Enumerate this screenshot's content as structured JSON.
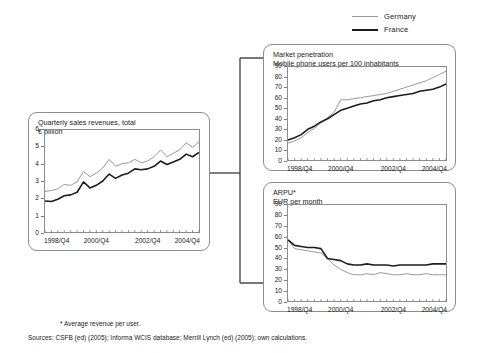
{
  "legend": {
    "items": [
      {
        "label": "Germany",
        "color": "#9a9a9a",
        "style": "thin"
      },
      {
        "label": "France",
        "color": "#1c1c1c",
        "style": "thick"
      }
    ]
  },
  "footnotes": {
    "star": "* Average revenue per user.",
    "sources": "Sources: CSFB (ed) (2005); Informa WCIS database; Merrill Lynch (ed) (2005); own calculations."
  },
  "panels": {
    "left": {
      "title_line1": "Quarterly sales revenues, total",
      "title_line2": "€ billion"
    },
    "penetration": {
      "title_line1": "Market penetration",
      "title_line2": "Mobile phone users per 100 inhabitants"
    },
    "arpu": {
      "title_line1": "ARPU*",
      "title_line2": "EUR per month"
    }
  },
  "chart_data": [
    {
      "id": "left",
      "type": "line",
      "title": "Quarterly sales revenues, total",
      "ylabel": "€ billion",
      "xlabel": "",
      "ylim": [
        0,
        6
      ],
      "yticks": [
        0,
        1,
        2,
        3,
        4,
        5,
        6
      ],
      "ytick_labels": [
        "0",
        "1",
        "2",
        "3",
        "4",
        "5",
        "6"
      ],
      "xtick_labels": [
        "1998/Q4",
        "2000/Q4",
        "2002/Q4",
        "2004/Q4"
      ],
      "xtick_positions": [
        0,
        8,
        16,
        24
      ],
      "x_count": 25,
      "grid": false,
      "legend_position": "top-right-external",
      "series": [
        {
          "name": "Germany",
          "color": "#9a9a9a",
          "values": [
            2.4,
            2.45,
            2.55,
            2.8,
            2.75,
            2.95,
            3.55,
            3.25,
            3.45,
            3.75,
            4.25,
            3.85,
            4.0,
            4.05,
            4.25,
            4.05,
            4.15,
            4.4,
            4.8,
            4.4,
            4.6,
            4.8,
            5.2,
            4.95,
            5.25
          ]
        },
        {
          "name": "France",
          "color": "#1c1c1c",
          "values": [
            1.85,
            1.82,
            1.95,
            2.15,
            2.2,
            2.35,
            2.95,
            2.6,
            2.75,
            3.0,
            3.4,
            3.15,
            3.35,
            3.45,
            3.7,
            3.65,
            3.7,
            3.85,
            4.15,
            3.95,
            4.1,
            4.25,
            4.55,
            4.4,
            4.65
          ]
        }
      ]
    },
    {
      "id": "penetration",
      "type": "line",
      "title": "Market penetration",
      "ylabel": "Mobile phone users per 100 inhabitants",
      "xlabel": "",
      "ylim": [
        0,
        90
      ],
      "yticks": [
        0,
        10,
        20,
        30,
        40,
        50,
        60,
        70,
        80,
        90
      ],
      "ytick_labels": [
        "0",
        "10",
        "20",
        "30",
        "40",
        "50",
        "60",
        "70",
        "80",
        "90"
      ],
      "xtick_labels": [
        "1998/Q4",
        "2000/Q4",
        "2002/Q4",
        "2004/Q4"
      ],
      "xtick_positions": [
        0,
        8,
        16,
        24
      ],
      "x_count": 25,
      "grid": false,
      "legend_position": "top-right-external",
      "series": [
        {
          "name": "Germany",
          "color": "#9a9a9a",
          "values": [
            17,
            19,
            22,
            27,
            31,
            36,
            41,
            46,
            58,
            58,
            59,
            60,
            61,
            62,
            63,
            64,
            66,
            68,
            70,
            72,
            74,
            76,
            79,
            82,
            85
          ]
        },
        {
          "name": "France",
          "color": "#1c1c1c",
          "values": [
            20,
            22,
            25,
            30,
            33,
            37,
            40,
            44,
            48,
            50,
            52,
            54,
            55,
            57,
            58,
            60,
            61,
            62,
            63,
            64,
            66,
            67,
            68,
            70,
            73
          ]
        }
      ]
    },
    {
      "id": "arpu",
      "type": "line",
      "title": "ARPU*",
      "ylabel": "EUR per month",
      "xlabel": "",
      "ylim": [
        0,
        90
      ],
      "yticks": [
        0,
        10,
        20,
        30,
        40,
        50,
        60,
        70,
        80,
        90
      ],
      "ytick_labels": [
        "0",
        "10",
        "20",
        "30",
        "40",
        "50",
        "60",
        "70",
        "80",
        "90"
      ],
      "xtick_labels": [
        "1998/Q4",
        "2000/Q4",
        "2002/Q4",
        "2004/Q4"
      ],
      "xtick_positions": [
        0,
        8,
        16,
        24
      ],
      "x_count": 25,
      "grid": false,
      "legend_position": "top-right-external",
      "series": [
        {
          "name": "Germany",
          "color": "#9a9a9a",
          "values": [
            57,
            49,
            48,
            47,
            46,
            45,
            40,
            34,
            30,
            27,
            25,
            25,
            26,
            25,
            27,
            26,
            25,
            25,
            26,
            25,
            25,
            26,
            25,
            25,
            25
          ]
        },
        {
          "name": "France",
          "color": "#1c1c1c",
          "values": [
            57,
            52,
            51,
            50,
            50,
            49,
            40,
            39,
            38,
            35,
            34,
            34,
            35,
            34,
            34,
            34,
            33,
            34,
            34,
            34,
            34,
            34,
            35,
            35,
            35
          ]
        }
      ]
    }
  ],
  "connectors": {
    "description": "bracket linking left panel to the two right panels"
  }
}
